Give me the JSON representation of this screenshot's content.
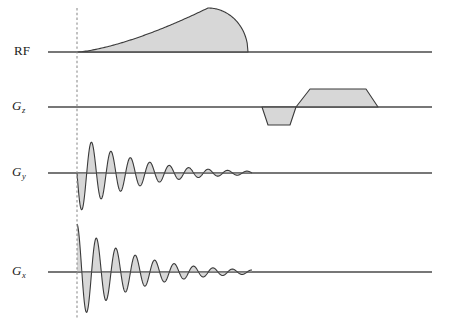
{
  "figure": {
    "type": "mri-pulse-sequence-diagram",
    "width": 449,
    "height": 328,
    "background_color": "#ffffff",
    "line_color": "#3a3a3a",
    "fill_color": "#d7d7d7",
    "dashed_marker_color": "#9a9a9a"
  },
  "channels": [
    {
      "id": "rf",
      "label_text": "RF",
      "label_style": "upright",
      "label_x": 14,
      "label_y": 44,
      "baseline_y": 52,
      "baseline_x_start": 48,
      "baseline_x_end": 432
    },
    {
      "id": "gz",
      "label_base": "G",
      "label_sub": "z",
      "label_style": "italic",
      "label_x": 12,
      "label_y": 99,
      "baseline_y": 107,
      "baseline_x_start": 48,
      "baseline_x_end": 432
    },
    {
      "id": "gy",
      "label_base": "G",
      "label_sub": "y",
      "label_style": "italic",
      "label_x": 12,
      "label_y": 165,
      "baseline_y": 173,
      "baseline_x_start": 48,
      "baseline_x_end": 432
    },
    {
      "id": "gx",
      "label_base": "G",
      "label_sub": "x",
      "label_style": "italic",
      "label_x": 12,
      "label_y": 264,
      "baseline_y": 272,
      "baseline_x_start": 48,
      "baseline_x_end": 432
    }
  ],
  "time_marker": {
    "name": "excitation-time-marker",
    "x": 77,
    "y_top": 8,
    "y_bottom": 320,
    "style": "dashed"
  },
  "chart_data": {
    "type": "line",
    "title": "",
    "xlabel": "",
    "ylabel": "",
    "series": [
      {
        "name": "RF",
        "waveform": "asymmetric-ramped-envelope",
        "start_x": 77,
        "peak_x": 208,
        "end_x": 248,
        "baseline_y": 52,
        "peak_amplitude": 44,
        "description": "Slowly rising ramped RF excitation envelope peaking near its end then falling sharply to baseline"
      },
      {
        "name": "Gz",
        "waveform": "bipolar-trapezoid-pair",
        "baseline_y": 107,
        "lobes": [
          {
            "polarity": "negative",
            "ramp_up_start_x": 262,
            "plateau_start_x": 268,
            "plateau_end_x": 290,
            "ramp_down_end_x": 296,
            "amplitude": -18
          },
          {
            "polarity": "positive",
            "ramp_up_start_x": 296,
            "plateau_start_x": 310,
            "plateau_end_x": 366,
            "ramp_down_end_x": 378,
            "amplitude": 18
          }
        ]
      },
      {
        "name": "Gy",
        "waveform": "damped-sine-oscillation",
        "baseline_y": 173,
        "start_x": 77,
        "end_x": 252,
        "initial_amplitude": 40,
        "phase": "sine-negative-first",
        "cycles": 9,
        "decay": "exponential",
        "description": "Damped oscillating phase-encode gradient beginning with a negative half-cycle at the excitation marker"
      },
      {
        "name": "Gx",
        "waveform": "damped-cosine-oscillation",
        "baseline_y": 272,
        "start_x": 77,
        "end_x": 252,
        "initial_amplitude": 48,
        "phase": "cosine-positive-peak-first",
        "cycles": 9,
        "decay": "exponential",
        "description": "Damped oscillating readout gradient starting at a positive peak at the excitation marker, 90 degrees out of phase with Gy"
      }
    ],
    "legend": "none",
    "grid": false
  }
}
